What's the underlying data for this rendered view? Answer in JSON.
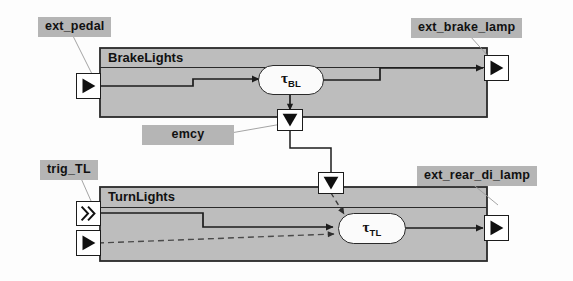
{
  "diagram": {
    "colors": {
      "block_fill": "#bdbdbd",
      "block_border": "#2a2a2a",
      "label_highlight": "#b5b5b5",
      "node_fill": "#fbfbfb",
      "signal_line": "#1c1c1c",
      "dashed_line": "#6b6b6b",
      "port_fill": "#ffffff"
    },
    "annotations": [
      {
        "id": "ext_pedal",
        "text": "ext_pedal"
      },
      {
        "id": "ext_brake_lamp",
        "text": "ext_brake_lamp"
      },
      {
        "id": "emcy",
        "text": "emcy"
      },
      {
        "id": "trig_TL",
        "text": "trig_TL"
      },
      {
        "id": "ext_rear_di_lamp",
        "text": "ext_rear_di_lamp"
      }
    ],
    "blocks": [
      {
        "id": "brake_lights",
        "title": "BrakeLights"
      },
      {
        "id": "turn_lights",
        "title": "TurnLights"
      }
    ],
    "nodes": [
      {
        "id": "tau_bl",
        "symbol": "τ",
        "subscript": "BL"
      },
      {
        "id": "tau_tl",
        "symbol": "τ",
        "subscript": "TL"
      }
    ],
    "ports": [
      {
        "id": "brake-input-port",
        "kind": "data-in",
        "glyph": "right-triangle",
        "block": "BrakeLights"
      },
      {
        "id": "brake-output-port",
        "kind": "data-out",
        "glyph": "right-triangle",
        "block": "BrakeLights"
      },
      {
        "id": "emcy-output-port",
        "kind": "event-out",
        "glyph": "down-triangle",
        "block": "BrakeLights"
      },
      {
        "id": "emcy-input-port",
        "kind": "event-in",
        "glyph": "down-triangle",
        "block": "TurnLights"
      },
      {
        "id": "trig-event-input-port",
        "kind": "event-in",
        "glyph": "double-chevron",
        "block": "TurnLights"
      },
      {
        "id": "turn-data-input-port",
        "kind": "data-in",
        "glyph": "right-triangle",
        "block": "TurnLights"
      },
      {
        "id": "turn-output-port",
        "kind": "data-out",
        "glyph": "right-triangle",
        "block": "TurnLights"
      }
    ],
    "connections": [
      {
        "id": "pedal-to-tau-bl",
        "from": "brake-input-port",
        "to": "tau_bl",
        "style": "solid"
      },
      {
        "id": "tau-bl-to-lamp",
        "from": "tau_bl",
        "to": "brake-output-port",
        "style": "solid"
      },
      {
        "id": "tau-bl-to-emcy",
        "from": "tau_bl",
        "to": "emcy-output-port",
        "style": "solid"
      },
      {
        "id": "emcy-to-turn",
        "from": "emcy-output-port",
        "to": "emcy-input-port",
        "style": "solid"
      },
      {
        "id": "emcy-to-tau-tl",
        "from": "emcy-input-port",
        "to": "tau_tl",
        "style": "dashed"
      },
      {
        "id": "trig-to-tau-tl",
        "from": "trig-event-input-port",
        "to": "tau_tl",
        "style": "solid"
      },
      {
        "id": "data-to-tau-tl",
        "from": "turn-data-input-port",
        "to": "tau_tl",
        "style": "dashed"
      },
      {
        "id": "tau-tl-to-lamp",
        "from": "tau_tl",
        "to": "turn-output-port",
        "style": "solid"
      }
    ]
  }
}
